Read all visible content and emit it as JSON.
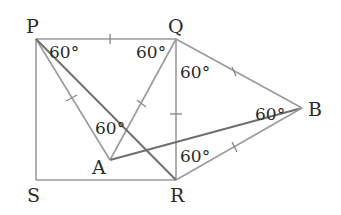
{
  "diagram": {
    "type": "geometry",
    "colors": {
      "line": "#9a9a9a",
      "line_dark": "#6e6e6e",
      "text": "#2a2a2a",
      "background": "#ffffff"
    },
    "vertices": {
      "P": {
        "label": "P",
        "x": 36,
        "y": 39
      },
      "Q": {
        "label": "Q",
        "x": 176,
        "y": 39
      },
      "R": {
        "label": "R",
        "x": 176,
        "y": 180
      },
      "S": {
        "label": "S",
        "x": 36,
        "y": 180
      },
      "A": {
        "label": "A",
        "x": 110,
        "y": 160
      },
      "B": {
        "label": "B",
        "x": 302,
        "y": 108
      }
    },
    "angle_labels": [
      {
        "id": "angle-P",
        "text": "60°"
      },
      {
        "id": "angle-Q-left",
        "text": "60°"
      },
      {
        "id": "angle-Q-right",
        "text": "60°"
      },
      {
        "id": "angle-A",
        "text": "60°"
      },
      {
        "id": "angle-B",
        "text": "60°"
      },
      {
        "id": "angle-R",
        "text": "60°"
      }
    ],
    "segments": [
      "PQ",
      "QR",
      "RS",
      "SP",
      "PA",
      "QA",
      "PR",
      "AB",
      "QB",
      "RB"
    ],
    "equal_tick_segments": [
      "PQ",
      "PA",
      "QA",
      "QR",
      "QB",
      "RB"
    ]
  }
}
